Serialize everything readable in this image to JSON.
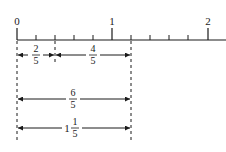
{
  "diagram": {
    "type": "number-line",
    "axis_labels": [
      {
        "value": 0,
        "text": "0"
      },
      {
        "value": 1,
        "text": "1"
      },
      {
        "value": 2,
        "text": "2"
      }
    ],
    "subdivisions_per_unit": 5,
    "segments": [
      {
        "from": 0,
        "to": 0.4,
        "whole": "",
        "numerator": "2",
        "denominator": "5"
      },
      {
        "from": 0.4,
        "to": 1.2,
        "whole": "",
        "numerator": "4",
        "denominator": "5"
      },
      {
        "from": 0,
        "to": 1.2,
        "whole": "",
        "numerator": "6",
        "denominator": "5"
      },
      {
        "from": 0,
        "to": 1.2,
        "whole": "1",
        "numerator": "1",
        "denominator": "5"
      }
    ],
    "line_color": "#1a1a1a"
  }
}
